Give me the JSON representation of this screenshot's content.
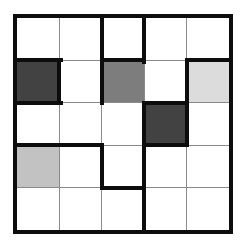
{
  "image": {
    "width": 244,
    "height": 252,
    "background": "#ffffff"
  },
  "puzzle_grid": {
    "rows": 5,
    "cols": 5,
    "colors": {
      "white": "#ffffff",
      "dark_gray": "#424242",
      "medium_gray": "#7d7d7d",
      "light_gray": "#dcdcdc",
      "pale_gray": "#c2c2c2",
      "thin_line": "#8a8a8a",
      "thick_line": "#0d0d0d"
    },
    "cells": [
      [
        "white",
        "white",
        "white",
        "white",
        "white"
      ],
      [
        "dark_gray",
        "white",
        "medium_gray",
        "white",
        "light_gray"
      ],
      [
        "white",
        "white",
        "white",
        "dark_gray",
        "white"
      ],
      [
        "pale_gray",
        "white",
        "white",
        "white",
        "white"
      ],
      [
        "white",
        "white",
        "white",
        "white",
        "white"
      ]
    ],
    "thick_horizontal_edges": [
      {
        "after_row": 0,
        "cols": [
          0,
          2,
          4
        ]
      },
      {
        "after_row": 1,
        "cols": [
          0,
          3
        ]
      },
      {
        "after_row": 2,
        "cols": [
          0,
          1,
          3
        ]
      },
      {
        "after_row": 3,
        "cols": [
          2
        ]
      }
    ],
    "thick_vertical_edges": [
      {
        "after_col": 0,
        "rows": [
          1
        ]
      },
      {
        "after_col": 1,
        "rows": [
          0,
          1,
          3
        ]
      },
      {
        "after_col": 2,
        "rows": [
          0,
          2,
          3,
          4
        ]
      },
      {
        "after_col": 3,
        "rows": [
          1,
          2
        ]
      }
    ],
    "layout": {
      "grid_left": 13,
      "grid_top": 14,
      "grid_inner_size": 212,
      "outer_border_px": 4,
      "thin_px": 1,
      "thick_px": 4
    }
  }
}
